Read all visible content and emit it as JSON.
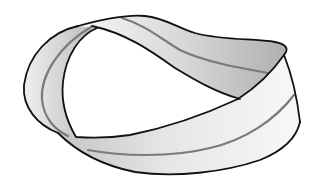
{
  "figure": {
    "style": "grayscale line drawing with centerline stripe",
    "colors": {
      "background": "#ffffff",
      "outline": "#111111",
      "centerline": "#7a7a7a",
      "surface_light": "#f4f4f4",
      "surface_dark": "#bdbdbd"
    }
  }
}
